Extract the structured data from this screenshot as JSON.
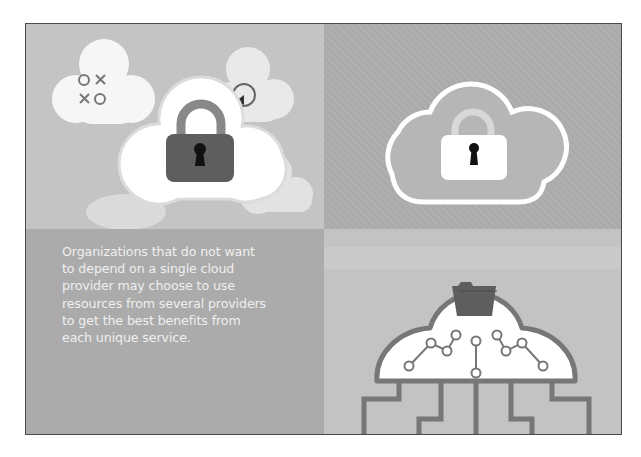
{
  "illustration": {
    "panels": [
      {
        "id": "top-left",
        "description": "Lock in cloud with surrounding app clouds",
        "icons": [
          "padlock-icon",
          "tic-tac-toe-icon",
          "clock-icon",
          "refresh-icon"
        ]
      },
      {
        "id": "top-right",
        "description": "Outlined cloud containing padlock",
        "icons": [
          "cloud-outline-icon",
          "padlock-icon"
        ]
      },
      {
        "id": "bottom-left",
        "description": "Text panel"
      },
      {
        "id": "bottom-right",
        "description": "Cloud with folder and circuit connections",
        "icons": [
          "folder-icon",
          "circuit-icon"
        ]
      }
    ],
    "tic_tac_toe": {
      "row1": [
        "O",
        "X"
      ],
      "row2": [
        "X",
        "O"
      ]
    },
    "caption_lines": [
      "Organizations that do not want",
      "to depend on a single cloud",
      "provider may choose to use",
      "resources from several providers",
      "to get the best benefits from",
      "each unique service."
    ],
    "colors": {
      "frame_border": "#4a4a4a",
      "panel_light": "#c4c4c4",
      "panel_mid": "#adadad",
      "panel_text": "#ababab",
      "cloud_white": "#ffffff",
      "lock_dark": "#5e5e5e",
      "circuit": "#777777"
    }
  }
}
